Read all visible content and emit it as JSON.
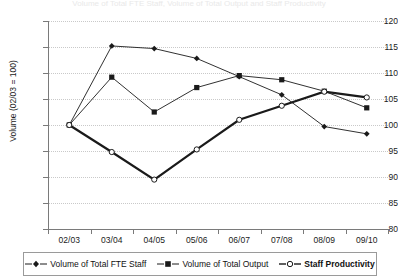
{
  "chart_data": {
    "type": "line",
    "title": "Volume of Total FTE Staff, Volume of Total Output and Staff Productivity",
    "xlabel": "",
    "ylabel": "Volume (02/03 = 100)",
    "categories": [
      "02/03",
      "03/04",
      "04/05",
      "05/06",
      "06/07",
      "07/08",
      "08/09",
      "09/10"
    ],
    "ylim": [
      80,
      120
    ],
    "ytick_values": [
      80,
      85,
      90,
      95,
      100,
      105,
      110,
      115,
      120
    ],
    "ytick_labels": [
      "80",
      "85",
      "90",
      "95",
      "100",
      "105",
      "110",
      "115",
      "120"
    ],
    "grid": true,
    "legend_position": "bottom",
    "series": [
      {
        "name": "Volume of Total FTE Staff",
        "marker": "diamond",
        "values": [
          100.0,
          115.2,
          114.7,
          112.8,
          109.3,
          105.8,
          99.7,
          98.3
        ]
      },
      {
        "name": "Volume of Total Output",
        "marker": "square",
        "values": [
          100.0,
          109.2,
          102.5,
          107.2,
          109.5,
          108.7,
          106.5,
          103.3
        ]
      },
      {
        "name": "Staff Productivity",
        "marker": "open-circle",
        "emphasis": "bold",
        "values": [
          100.0,
          94.8,
          89.5,
          95.3,
          101.0,
          103.7,
          106.4,
          105.3
        ]
      }
    ]
  },
  "legend": {
    "items": [
      {
        "label": "Volume of Total FTE Staff",
        "marker": "diamond",
        "bold": false
      },
      {
        "label": "Volume of Total Output",
        "marker": "square",
        "bold": false
      },
      {
        "label": "Staff Productivity",
        "marker": "open-circle",
        "bold": true
      }
    ]
  },
  "colors": {
    "line": "#1a1a1a",
    "grid": "#c9c9c9",
    "axis": "#7a7a7a",
    "text": "#111111"
  }
}
